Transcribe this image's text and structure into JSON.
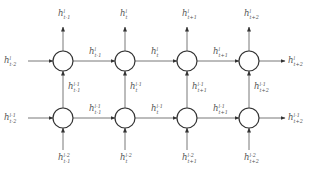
{
  "diagram": {
    "type": "stacked recurrent neural network (unrolled)",
    "columns": [
      "t-1",
      "t",
      "t+1",
      "t+2"
    ],
    "layers": [
      "l",
      "l-1"
    ],
    "outputs_top": [
      {
        "base": "h",
        "sup": "l",
        "sub": "t-1"
      },
      {
        "base": "h",
        "sup": "l",
        "sub": "t"
      },
      {
        "base": "h",
        "sup": "l",
        "sub": "t+1"
      },
      {
        "base": "h",
        "sup": "l",
        "sub": "t+2"
      }
    ],
    "row_top": {
      "input_left": {
        "base": "h",
        "sup": "l",
        "sub": "t-2"
      },
      "output_right": {
        "base": "h",
        "sup": "l",
        "sub": "t+2"
      },
      "between": [
        {
          "base": "h",
          "sup": "l",
          "sub": "t-1"
        },
        {
          "base": "h",
          "sup": "l",
          "sub": "t"
        },
        {
          "base": "h",
          "sup": "l",
          "sub": "t+1"
        }
      ]
    },
    "vertical_middle": [
      {
        "base": "h",
        "sup": "l-1",
        "sub": "t-1"
      },
      {
        "base": "h",
        "sup": "l-1",
        "sub": "t"
      },
      {
        "base": "h",
        "sup": "l-1",
        "sub": "t+1"
      },
      {
        "base": "h",
        "sup": "l-1",
        "sub": "t+2"
      }
    ],
    "row_bottom": {
      "input_left": {
        "base": "h",
        "sup": "l-1",
        "sub": "t-2"
      },
      "output_right": {
        "base": "h",
        "sup": "l-1",
        "sub": "t+2"
      },
      "between": [
        {
          "base": "h",
          "sup": "l-1",
          "sub": "t-1"
        },
        {
          "base": "h",
          "sup": "l-1",
          "sub": "t"
        },
        {
          "base": "h",
          "sup": "l-1",
          "sub": "t+1"
        }
      ]
    },
    "inputs_bottom": [
      {
        "base": "h",
        "sup": "l-2",
        "sub": "t-1"
      },
      {
        "base": "h",
        "sup": "l-2",
        "sub": "t"
      },
      {
        "base": "h",
        "sup": "l-2",
        "sub": "t+1"
      },
      {
        "base": "h",
        "sup": "l-2",
        "sub": "t+2"
      }
    ],
    "colors": {
      "line": "#555555",
      "node_stroke": "#333333",
      "text": "#555555"
    }
  }
}
